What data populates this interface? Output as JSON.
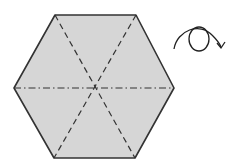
{
  "diagram": {
    "type": "origami-fold-diagram",
    "shape": "hexagon",
    "fill_color": "#d6d6d6",
    "outline_color": "#333333",
    "fold_lines": [
      {
        "name": "diagonal-tl-br",
        "style": "valley (dashed)"
      },
      {
        "name": "diagonal-tr-bl",
        "style": "valley (dashed)"
      },
      {
        "name": "horizontal",
        "style": "mountain (dash-dot)"
      }
    ],
    "symbol": "turn-over-arrow"
  }
}
